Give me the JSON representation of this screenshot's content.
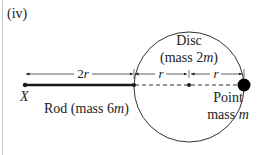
{
  "figure": {
    "part_label": "(iv)",
    "labels": {
      "point_x": "X",
      "rod": "Rod (mass 6",
      "rod_m": "m",
      "rod_close": ")",
      "disc_title": "Disc",
      "disc_mass": "(mass 2",
      "disc_m": "m",
      "disc_close": ")",
      "point_mass_line1": "Point",
      "point_mass_line2": "mass ",
      "point_mass_m": "m"
    },
    "dimensions": {
      "rod_length": "2",
      "rod_length_var": "r",
      "disc_half_left": "r",
      "disc_half_right": "r"
    },
    "colors": {
      "stroke": "#1a1a1a",
      "text": "#222222",
      "border": "#c8c8c8"
    }
  }
}
